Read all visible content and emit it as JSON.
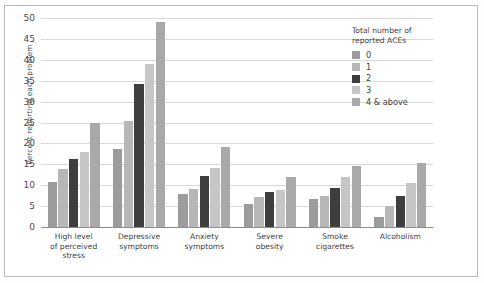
{
  "chart_data": {
    "type": "bar",
    "title": "",
    "xlabel": "",
    "ylabel": "Percent reporting each problem",
    "ylim": [
      0,
      50
    ],
    "yticks": [
      0,
      5,
      10,
      15,
      20,
      25,
      30,
      35,
      40,
      45,
      50
    ],
    "grid": true,
    "legend_position": "right",
    "legend_title": "Total number of\nreported ACEs",
    "categories": [
      "High level\nof perceived\nstress",
      "Depressive\nsymptoms",
      "Anxiety\nsymptoms",
      "Severe\nobesity",
      "Smoke\ncigarettes",
      "Alcoholism"
    ],
    "series": [
      {
        "name": "0",
        "color": "#9c9c9c",
        "values": [
          10.8,
          18.7,
          8.0,
          5.5,
          6.6,
          2.5
        ]
      },
      {
        "name": "1",
        "color": "#b7b7b7",
        "values": [
          13.8,
          25.3,
          9.1,
          7.3,
          7.4,
          5.0
        ]
      },
      {
        "name": "2",
        "color": "#3e3e3e",
        "values": [
          16.2,
          34.3,
          12.3,
          8.4,
          9.4,
          7.5
        ]
      },
      {
        "name": "3",
        "color": "#c6c6c6",
        "values": [
          18.0,
          39.0,
          14.0,
          8.8,
          11.9,
          10.6
        ]
      },
      {
        "name": "4 & above",
        "color": "#a9a9a9",
        "values": [
          25.0,
          49.0,
          19.2,
          12.0,
          14.5,
          15.3
        ]
      }
    ]
  },
  "colors": {
    "gridline": "#d8d8d8",
    "axis": "#8e8e8e",
    "frame": "#b9b9b9",
    "text": "#3f3f3f"
  }
}
